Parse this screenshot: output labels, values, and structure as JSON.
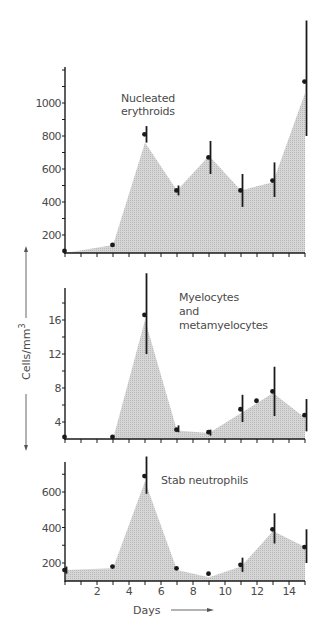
{
  "chart_data": [
    {
      "type": "area",
      "title": "Nucleated erythroids",
      "title_lines": [
        "Nucleated",
        "erythroids"
      ],
      "xlabel": "Days",
      "ylabel": "Cells/mm3",
      "xlim": [
        0,
        15
      ],
      "ylim": [
        90,
        1200
      ],
      "yticks": [
        200,
        400,
        600,
        800,
        1000
      ],
      "grid": false,
      "area_outline": {
        "x": [
          0,
          3,
          5,
          7,
          9,
          11,
          13,
          15
        ],
        "y": [
          90,
          140,
          760,
          470,
          680,
          470,
          520,
          1060
        ]
      },
      "points": [
        {
          "day": 0,
          "value": 90
        },
        {
          "day": 3,
          "value": 140
        },
        {
          "day": 5,
          "value": 810,
          "err_low": 760,
          "err_high": 860
        },
        {
          "day": 7,
          "value": 470,
          "err_low": 440,
          "err_high": 500
        },
        {
          "day": 9,
          "value": 670,
          "err_low": 570,
          "err_high": 770
        },
        {
          "day": 11,
          "value": 470,
          "err_low": 370,
          "err_high": 570
        },
        {
          "day": 13,
          "value": 530,
          "err_low": 430,
          "err_high": 640
        },
        {
          "day": 15,
          "value": 1130,
          "err_low": 800,
          "err_high": 1500
        }
      ]
    },
    {
      "type": "area",
      "title": "Myelocytes and metamyelocytes",
      "title_lines": [
        "Myelocytes",
        "and",
        "metamyelocytes"
      ],
      "xlabel": "Days",
      "ylabel": "Cells/mm3",
      "xlim": [
        0,
        15
      ],
      "ylim": [
        2,
        19
      ],
      "yticks": [
        4,
        8,
        12,
        16
      ],
      "grid": false,
      "area_outline": {
        "x": [
          0,
          3,
          5,
          7,
          9,
          13,
          15
        ],
        "y": [
          2,
          2,
          16,
          3,
          2.7,
          7.4,
          4.5
        ]
      },
      "points": [
        {
          "day": 0,
          "value": 2.2
        },
        {
          "day": 3,
          "value": 2.2
        },
        {
          "day": 5,
          "value": 16.6,
          "err_low": 12,
          "err_high": 21.5
        },
        {
          "day": 7,
          "value": 3.1,
          "err_low": 2.8,
          "err_high": 3.6
        },
        {
          "day": 9,
          "value": 2.8,
          "err_low": 2.4,
          "err_high": 3.1
        },
        {
          "day": 11,
          "value": 5.5,
          "err_low": 4.0,
          "err_high": 7.2
        },
        {
          "day": 12,
          "value": 6.5
        },
        {
          "day": 13,
          "value": 7.6,
          "err_low": 4.7,
          "err_high": 10.5
        },
        {
          "day": 15,
          "value": 4.8,
          "err_low": 2.9,
          "err_high": 6.7
        }
      ]
    },
    {
      "type": "area",
      "title": "Stab neutrophils",
      "title_lines": [
        "Stab neutrophils"
      ],
      "xlabel": "Days",
      "ylabel": "Cells/mm3",
      "xlim": [
        0,
        15
      ],
      "ylim": [
        100,
        770
      ],
      "yticks": [
        200,
        400,
        600
      ],
      "xticks": [
        2,
        4,
        6,
        8,
        10,
        12,
        14
      ],
      "grid": false,
      "area_outline": {
        "x": [
          0,
          3,
          5,
          7,
          9,
          11,
          13,
          15
        ],
        "y": [
          160,
          170,
          660,
          160,
          120,
          180,
          380,
          290
        ]
      },
      "points": [
        {
          "day": 0,
          "value": 160,
          "err_low": 140,
          "err_high": 180
        },
        {
          "day": 3,
          "value": 180
        },
        {
          "day": 5,
          "value": 690,
          "err_low": 590,
          "err_high": 800
        },
        {
          "day": 7,
          "value": 170
        },
        {
          "day": 9,
          "value": 140
        },
        {
          "day": 11,
          "value": 190,
          "err_low": 150,
          "err_high": 230
        },
        {
          "day": 13,
          "value": 390,
          "err_low": 310,
          "err_high": 480
        },
        {
          "day": 15,
          "value": 290,
          "err_low": 200,
          "err_high": 390
        }
      ]
    }
  ],
  "axes": {
    "ylabel": "Cells/mm",
    "ylabel_sup": "3",
    "xlabel": "Days",
    "xtick_labels": [
      "2",
      "4",
      "6",
      "8",
      "10",
      "12",
      "14"
    ]
  },
  "colors": {
    "fill": "#c8c8c8",
    "ink": "#1a1a1a",
    "text": "#4a4a4a"
  }
}
